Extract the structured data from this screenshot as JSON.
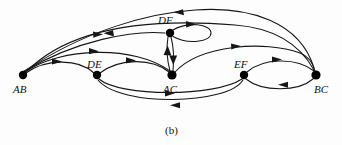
{
  "figure": {
    "caption": "(b)",
    "type": "directed-graph",
    "background_color": "#fdfdfd",
    "ink_color": "#161616"
  },
  "graph": {
    "nodes": [
      {
        "id": "AB",
        "label": "AB",
        "x": 23,
        "y": 75,
        "label_x": 13,
        "label_y": 93,
        "radius": 4.2
      },
      {
        "id": "DE",
        "label": "DE",
        "x": 97,
        "y": 75,
        "label_x": 87,
        "label_y": 68,
        "radius": 4.2
      },
      {
        "id": "DF",
        "label": "DF",
        "x": 170,
        "y": 33,
        "label_x": 158,
        "label_y": 24,
        "radius": 4.2
      },
      {
        "id": "AC",
        "label": "AC",
        "x": 172,
        "y": 75,
        "label_x": 163,
        "label_y": 93,
        "radius": 4.6
      },
      {
        "id": "EF",
        "label": "EF",
        "x": 244,
        "y": 75,
        "label_x": 234,
        "label_y": 68,
        "radius": 4.2
      },
      {
        "id": "BC",
        "label": "BC",
        "x": 316,
        "y": 75,
        "label_x": 314,
        "label_y": 93,
        "radius": 4.6
      }
    ],
    "edges": [
      {
        "from": "BC",
        "to": "AB",
        "kind": "arc-top",
        "arrow_at": 0.52
      },
      {
        "from": "DF",
        "to": "AB",
        "kind": "arc-upper",
        "arrow_at": 0.52
      },
      {
        "from": "AB",
        "to": "AC",
        "kind": "arc-long",
        "arrow_at": 0.46
      },
      {
        "from": "AB",
        "to": "DE",
        "kind": "arc-short",
        "arrow_at": 0.48
      },
      {
        "from": "DE",
        "to": "AC",
        "kind": "arc-short",
        "arrow_at": 0.48
      },
      {
        "from": "AB",
        "to": "BC",
        "kind": "arc-outer",
        "arrow_at": 0.5
      },
      {
        "from": "AC",
        "to": "DF",
        "kind": "vertical-up",
        "arrow_at": 0.55
      },
      {
        "from": "DF",
        "to": "AC",
        "kind": "vertical-dn",
        "arrow_at": 0.5
      },
      {
        "from": "DF",
        "to": "DF",
        "kind": "self-loop",
        "arrow_at": 0.25
      },
      {
        "from": "AC",
        "to": "BC",
        "kind": "arc-long",
        "arrow_at": 0.48
      },
      {
        "from": "EF",
        "to": "BC",
        "kind": "arc-upper",
        "arrow_at": 0.5
      },
      {
        "from": "BC",
        "to": "EF",
        "kind": "arc-lower",
        "arrow_at": 0.52
      },
      {
        "from": "DE",
        "to": "EF",
        "kind": "arc-below",
        "arrow_at": 0.5
      },
      {
        "from": "EF",
        "to": "DE",
        "kind": "arc-below2",
        "arrow_at": 0.52
      }
    ]
  }
}
